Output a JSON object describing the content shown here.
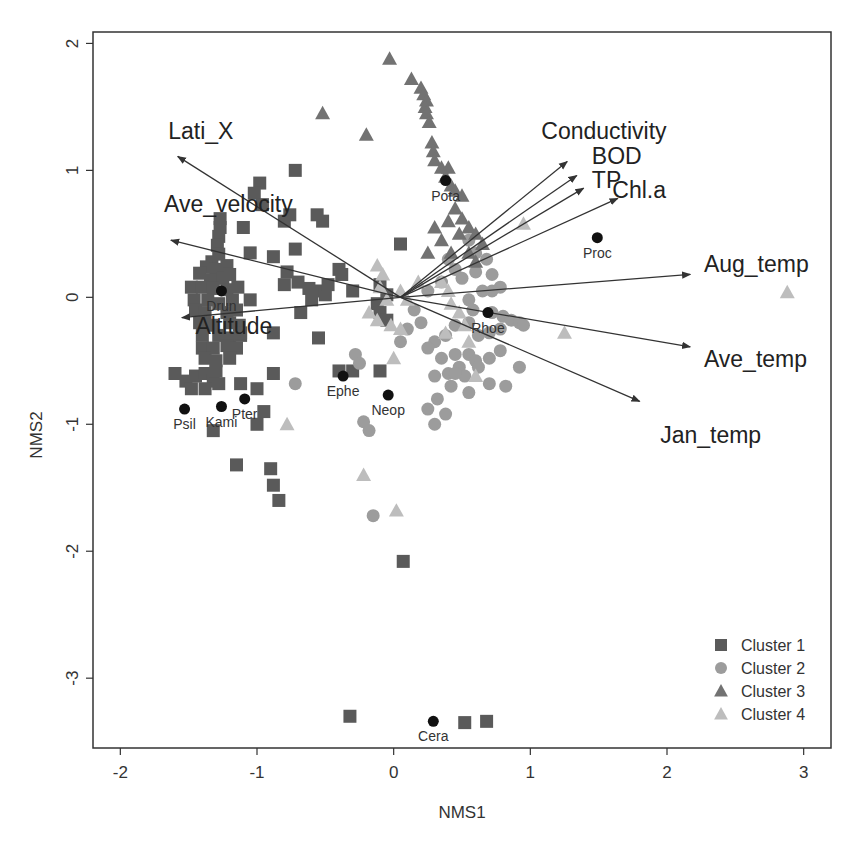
{
  "chart_data": {
    "type": "scatter",
    "title": "",
    "xlabel": "NMS1",
    "ylabel": "NMS2",
    "xlim": [
      -2.2,
      3.2
    ],
    "ylim": [
      -3.55,
      2.09
    ],
    "x_ticks": [
      -2,
      -1,
      0,
      1,
      2,
      3
    ],
    "y_ticks": [
      -3,
      -2,
      -1,
      0,
      1,
      2
    ],
    "x_tick_labels": [
      "-2",
      "-1",
      "0",
      "1",
      "2",
      "3"
    ],
    "y_tick_labels": [
      "-3",
      "-2",
      "-1",
      "0",
      "1",
      "2"
    ],
    "grid": false,
    "legend": {
      "position": "bottom-right",
      "entries": [
        {
          "label": "Cluster 1",
          "shape": "square",
          "color": "#5a5a5a"
        },
        {
          "label": "Cluster 2",
          "shape": "circle",
          "color": "#9c9c9c"
        },
        {
          "label": "Cluster 3",
          "shape": "triangle",
          "color": "#727272"
        },
        {
          "label": "Cluster 4",
          "shape": "triangle",
          "color": "#bdbdbd"
        }
      ]
    },
    "series": [
      {
        "name": "Cluster 1",
        "shape": "square",
        "color": "#5a5a5a",
        "points": [
          [
            -1.27,
            0.62
          ],
          [
            -1.27,
            0.55
          ],
          [
            -1.28,
            0.48
          ],
          [
            -1.29,
            0.41
          ],
          [
            -1.28,
            0.34
          ],
          [
            -1.33,
            0.28
          ],
          [
            -1.37,
            0.24
          ],
          [
            -1.3,
            0.22
          ],
          [
            -1.22,
            0.25
          ],
          [
            -1.42,
            0.19
          ],
          [
            -1.34,
            0.14
          ],
          [
            -1.25,
            0.15
          ],
          [
            -1.2,
            0.18
          ],
          [
            -1.48,
            0.08
          ],
          [
            -1.4,
            0.08
          ],
          [
            -1.32,
            0.07
          ],
          [
            -1.22,
            0.06
          ],
          [
            -1.14,
            0.08
          ],
          [
            -1.46,
            -0.02
          ],
          [
            -1.36,
            -0.02
          ],
          [
            -1.28,
            -0.05
          ],
          [
            -1.18,
            -0.02
          ],
          [
            -1.45,
            -0.1
          ],
          [
            -1.38,
            -0.12
          ],
          [
            -1.22,
            -0.12
          ],
          [
            -1.15,
            -0.1
          ],
          [
            -1.42,
            -0.2
          ],
          [
            -1.33,
            -0.22
          ],
          [
            -1.2,
            -0.2
          ],
          [
            -1.13,
            -0.22
          ],
          [
            -1.4,
            -0.3
          ],
          [
            -1.28,
            -0.3
          ],
          [
            -1.2,
            -0.32
          ],
          [
            -1.12,
            -0.3
          ],
          [
            -1.4,
            -0.4
          ],
          [
            -1.32,
            -0.4
          ],
          [
            -1.22,
            -0.38
          ],
          [
            -1.15,
            -0.4
          ],
          [
            -1.38,
            -0.48
          ],
          [
            -1.3,
            -0.5
          ],
          [
            -1.2,
            -0.48
          ],
          [
            -1.6,
            -0.6
          ],
          [
            -1.52,
            -0.66
          ],
          [
            -1.45,
            -0.62
          ],
          [
            -1.38,
            -0.6
          ],
          [
            -1.32,
            -0.66
          ],
          [
            -1.48,
            -0.72
          ],
          [
            -1.38,
            -0.72
          ],
          [
            -1.28,
            -0.68
          ],
          [
            -1.3,
            -0.58
          ],
          [
            -1.12,
            -0.68
          ],
          [
            -1.0,
            -0.72
          ],
          [
            -0.88,
            -0.6
          ],
          [
            -0.95,
            -0.9
          ],
          [
            -1.32,
            -1.05
          ],
          [
            -1.0,
            -1.0
          ],
          [
            -1.15,
            -1.32
          ],
          [
            -0.9,
            -1.35
          ],
          [
            -0.88,
            -1.48
          ],
          [
            -0.84,
            -1.6
          ],
          [
            -1.12,
            -0.28
          ],
          [
            -0.88,
            -0.28
          ],
          [
            -0.55,
            -0.32
          ],
          [
            -0.4,
            -0.58
          ],
          [
            -0.3,
            -0.58
          ],
          [
            -0.1,
            -0.58
          ],
          [
            -0.98,
            0.9
          ],
          [
            -1.02,
            0.82
          ],
          [
            -0.96,
            0.73
          ],
          [
            -0.8,
            0.6
          ],
          [
            -0.76,
            0.65
          ],
          [
            -0.56,
            0.65
          ],
          [
            -0.52,
            0.6
          ],
          [
            -0.72,
            1.0
          ],
          [
            -1.1,
            0.55
          ],
          [
            -1.05,
            0.35
          ],
          [
            -0.88,
            0.32
          ],
          [
            -0.78,
            0.2
          ],
          [
            -0.72,
            0.38
          ],
          [
            -0.8,
            0.1
          ],
          [
            -0.7,
            0.12
          ],
          [
            -0.62,
            0.07
          ],
          [
            -0.55,
            0.05
          ],
          [
            -0.6,
            -0.02
          ],
          [
            -0.5,
            0.02
          ],
          [
            -0.48,
            0.1
          ],
          [
            -0.38,
            0.18
          ],
          [
            -0.4,
            0.22
          ],
          [
            -0.3,
            0.05
          ],
          [
            -0.1,
            0.1
          ],
          [
            -0.05,
            0.02
          ],
          [
            0.05,
            0.42
          ],
          [
            -0.12,
            -0.05
          ],
          [
            -0.1,
            -0.12
          ],
          [
            -0.68,
            -0.12
          ],
          [
            -1.05,
            -0.02
          ],
          [
            -0.05,
            -0.18
          ],
          [
            0.07,
            -2.08
          ],
          [
            -0.32,
            -3.3
          ],
          [
            0.52,
            -3.35
          ],
          [
            0.68,
            -3.34
          ]
        ]
      },
      {
        "name": "Cluster 2",
        "shape": "circle",
        "color": "#9c9c9c",
        "points": [
          [
            0.55,
            0.45
          ],
          [
            0.6,
            0.35
          ],
          [
            0.68,
            0.3
          ],
          [
            0.6,
            0.2
          ],
          [
            0.72,
            0.18
          ],
          [
            0.65,
            0.05
          ],
          [
            0.72,
            0.05
          ],
          [
            0.55,
            -0.02
          ],
          [
            0.5,
            0.15
          ],
          [
            0.78,
            0.08
          ],
          [
            0.58,
            -0.1
          ],
          [
            0.72,
            -0.12
          ],
          [
            0.8,
            -0.15
          ],
          [
            0.86,
            -0.18
          ],
          [
            0.92,
            -0.2
          ],
          [
            0.95,
            -0.22
          ],
          [
            0.78,
            -0.25
          ],
          [
            0.7,
            -0.28
          ],
          [
            0.62,
            -0.3
          ],
          [
            0.55,
            -0.2
          ],
          [
            0.45,
            -0.22
          ],
          [
            0.38,
            -0.3
          ],
          [
            0.3,
            -0.35
          ],
          [
            0.25,
            -0.4
          ],
          [
            0.35,
            -0.48
          ],
          [
            0.45,
            -0.45
          ],
          [
            0.55,
            -0.45
          ],
          [
            0.6,
            -0.5
          ],
          [
            0.48,
            -0.55
          ],
          [
            0.4,
            -0.6
          ],
          [
            0.3,
            -0.62
          ],
          [
            0.42,
            -0.7
          ],
          [
            0.52,
            -0.62
          ],
          [
            0.62,
            -0.55
          ],
          [
            0.7,
            -0.48
          ],
          [
            0.78,
            -0.42
          ],
          [
            0.92,
            -0.55
          ],
          [
            0.82,
            -0.7
          ],
          [
            0.7,
            -0.68
          ],
          [
            0.55,
            -0.75
          ],
          [
            0.32,
            -0.8
          ],
          [
            0.25,
            -0.88
          ],
          [
            0.38,
            -0.92
          ],
          [
            0.3,
            -1.0
          ],
          [
            0.45,
            -0.6
          ],
          [
            0.2,
            -0.2
          ],
          [
            0.15,
            -0.1
          ],
          [
            0.25,
            0.05
          ],
          [
            0.1,
            -0.25
          ],
          [
            0.05,
            -0.35
          ],
          [
            -0.28,
            -0.45
          ],
          [
            -0.25,
            -0.52
          ],
          [
            -0.72,
            -0.68
          ],
          [
            -0.22,
            -0.98
          ],
          [
            -0.18,
            -1.05
          ],
          [
            -0.15,
            -1.72
          ],
          [
            0.4,
            0.3
          ],
          [
            0.45,
            0.22
          ],
          [
            0.35,
            0.12
          ]
        ]
      },
      {
        "name": "Cluster 3",
        "shape": "triangle",
        "color": "#727272",
        "points": [
          [
            -0.03,
            1.88
          ],
          [
            0.13,
            1.72
          ],
          [
            0.2,
            1.65
          ],
          [
            0.22,
            1.6
          ],
          [
            0.24,
            1.55
          ],
          [
            0.23,
            1.5
          ],
          [
            0.24,
            1.45
          ],
          [
            0.26,
            1.38
          ],
          [
            0.28,
            1.22
          ],
          [
            0.29,
            1.15
          ],
          [
            0.3,
            1.08
          ],
          [
            0.35,
            1.02
          ],
          [
            0.4,
            1.02
          ],
          [
            0.38,
            0.95
          ],
          [
            0.42,
            0.88
          ],
          [
            0.45,
            0.84
          ],
          [
            0.5,
            0.8
          ],
          [
            0.45,
            0.7
          ],
          [
            0.5,
            0.62
          ],
          [
            0.55,
            0.55
          ],
          [
            0.4,
            0.6
          ],
          [
            0.48,
            0.5
          ],
          [
            0.42,
            0.35
          ],
          [
            0.55,
            0.35
          ],
          [
            0.6,
            0.28
          ],
          [
            0.35,
            0.45
          ],
          [
            0.3,
            0.55
          ],
          [
            0.25,
            0.35
          ],
          [
            -0.52,
            1.45
          ],
          [
            -0.2,
            1.28
          ],
          [
            0.6,
            0.5
          ],
          [
            0.65,
            0.42
          ]
        ]
      },
      {
        "name": "Cluster 4",
        "shape": "triangle",
        "color": "#bdbdbd",
        "points": [
          [
            -0.12,
            0.25
          ],
          [
            -0.08,
            0.18
          ],
          [
            -0.1,
            0.08
          ],
          [
            -0.05,
            -0.02
          ],
          [
            -0.18,
            -0.12
          ],
          [
            -0.12,
            -0.18
          ],
          [
            -0.02,
            -0.22
          ],
          [
            0.05,
            -0.25
          ],
          [
            0.18,
            0.12
          ],
          [
            0.35,
            0.12
          ],
          [
            0.4,
            0.05
          ],
          [
            0.42,
            -0.05
          ],
          [
            0.48,
            -0.12
          ],
          [
            0.52,
            -0.22
          ],
          [
            0.38,
            -0.28
          ],
          [
            0.55,
            -0.35
          ],
          [
            0.6,
            -0.62
          ],
          [
            0.05,
            0.05
          ],
          [
            0.1,
            -0.02
          ],
          [
            0.0,
            -0.48
          ],
          [
            -0.78,
            -1.0
          ],
          [
            -0.22,
            -1.4
          ],
          [
            0.02,
            -1.68
          ],
          [
            1.25,
            -0.28
          ],
          [
            0.95,
            0.58
          ],
          [
            2.88,
            0.04
          ]
        ]
      }
    ],
    "taxa": [
      {
        "name": "Drun",
        "x": -1.26,
        "y": 0.05
      },
      {
        "name": "Psil",
        "x": -1.53,
        "y": -0.88
      },
      {
        "name": "Kami",
        "x": -1.26,
        "y": -0.86
      },
      {
        "name": "Pter",
        "x": -1.09,
        "y": -0.8
      },
      {
        "name": "Ephe",
        "x": -0.37,
        "y": -0.62
      },
      {
        "name": "Neop",
        "x": -0.04,
        "y": -0.77
      },
      {
        "name": "Pota",
        "x": 0.38,
        "y": 0.92
      },
      {
        "name": "Proc",
        "x": 1.49,
        "y": 0.47
      },
      {
        "name": "Rhoe",
        "x": 0.69,
        "y": -0.12
      },
      {
        "name": "Cera",
        "x": 0.29,
        "y": -3.34
      }
    ],
    "vector_origin": [
      0.05,
      0.0
    ],
    "vectors": [
      {
        "name": "Lati_X",
        "x": -1.58,
        "y": 1.11,
        "label_x": -1.65,
        "label_y": 1.25
      },
      {
        "name": "Ave_velocity",
        "x": -1.63,
        "y": 0.45,
        "label_x": -1.68,
        "label_y": 0.67
      },
      {
        "name": "Altitude",
        "x": -1.55,
        "y": -0.16,
        "label_x": -1.45,
        "label_y": -0.29
      },
      {
        "name": "Conductivity",
        "x": 1.27,
        "y": 1.07,
        "label_x": 1.08,
        "label_y": 1.25
      },
      {
        "name": "BOD",
        "x": 1.34,
        "y": 0.96,
        "label_x": 1.45,
        "label_y": 1.05
      },
      {
        "name": "TP",
        "x": 1.39,
        "y": 0.86,
        "label_x": 1.45,
        "label_y": 0.86
      },
      {
        "name": "Chl.a",
        "x": 1.64,
        "y": 0.78,
        "label_x": 1.6,
        "label_y": 0.78
      },
      {
        "name": "Aug_temp",
        "x": 2.17,
        "y": 0.18,
        "label_x": 2.27,
        "label_y": 0.2
      },
      {
        "name": "Ave_temp",
        "x": 2.17,
        "y": -0.39,
        "label_x": 2.27,
        "label_y": -0.55
      },
      {
        "name": "Jan_temp",
        "x": 1.8,
        "y": -0.82,
        "label_x": 1.95,
        "label_y": -1.15
      }
    ]
  }
}
